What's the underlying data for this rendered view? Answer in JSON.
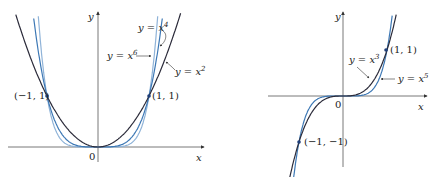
{
  "chart_data": [
    {
      "type": "line",
      "title": "",
      "xlabel": "x",
      "ylabel": "y",
      "origin_label": "0",
      "series": [
        {
          "name": "y = x^2",
          "label": "y = x",
          "exp": "2",
          "color": "#2b2b3a"
        },
        {
          "name": "y = x^4",
          "label": "y = x",
          "exp": "4",
          "color": "#3d78b5"
        },
        {
          "name": "y = x^6",
          "label": "y = x",
          "exp": "6",
          "color": "#8fb3d8"
        }
      ],
      "points": [
        {
          "label": "(−1, 1)",
          "x": -1,
          "y": 1
        },
        {
          "label": "(1, 1)",
          "x": 1,
          "y": 1
        }
      ],
      "xlim": [
        -1.8,
        2.0
      ],
      "ylim": [
        -0.3,
        2.8
      ],
      "grid": false
    },
    {
      "type": "line",
      "title": "",
      "xlabel": "x",
      "ylabel": "y",
      "origin_label": "0",
      "series": [
        {
          "name": "y = x^3",
          "label": "y = x",
          "exp": "3",
          "color": "#2b2b3a"
        },
        {
          "name": "y = x^5",
          "label": "y = x",
          "exp": "5",
          "color": "#3d78b5"
        }
      ],
      "points": [
        {
          "label": "(1, 1)",
          "x": 1,
          "y": 1
        },
        {
          "label": "(−1, −1)",
          "x": -1,
          "y": -1
        }
      ],
      "xlim": [
        -2.0,
        2.2
      ],
      "ylim": [
        -1.7,
        2.0
      ],
      "grid": false
    }
  ]
}
